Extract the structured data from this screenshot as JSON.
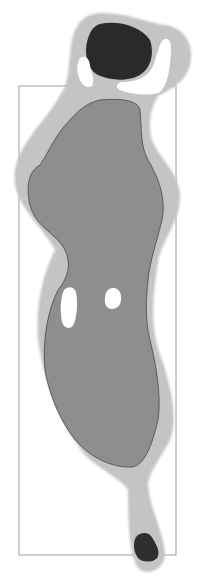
{
  "diagram": {
    "type": "golf-hole-layout",
    "colors": {
      "background": "#ffffff",
      "rough": "#c4c4c4",
      "fairway": "#8e8e8e",
      "fairway_outline": "#3a3a3a",
      "green": "#2a2a2a",
      "tee": "#2e2e2e",
      "bunker": "#ffffff",
      "frame": "#888888"
    },
    "elements": [
      "frame",
      "rough",
      "fairway",
      "green",
      "bunkers",
      "tee"
    ],
    "bunker_count": 4
  }
}
